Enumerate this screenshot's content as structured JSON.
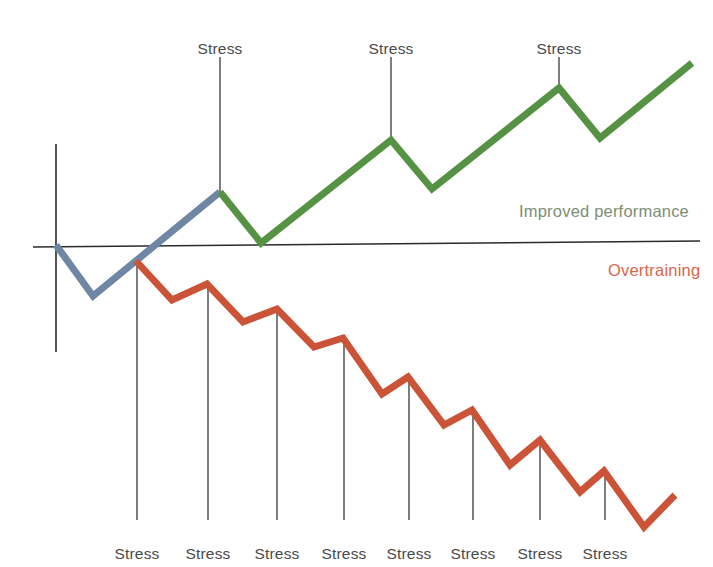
{
  "chart_data": {
    "type": "line",
    "title": "",
    "subtitle": "",
    "xlabel": "",
    "ylabel": "",
    "grid": false,
    "legend_position": "right-inline",
    "xlim": [
      0,
      713
    ],
    "ylim": [
      567,
      0
    ],
    "axes": {
      "x_axis": {
        "x1": 33,
        "y1": 247,
        "x2": 700,
        "y2": 241
      },
      "y_axis": {
        "x1": 56,
        "y1": 144,
        "x2": 56,
        "y2": 352
      },
      "origin": {
        "x": 56,
        "y": 245
      }
    },
    "annotations": [
      {
        "text": "Stress",
        "x": 220,
        "y": 40,
        "position": "top"
      },
      {
        "text": "Stress",
        "x": 391,
        "y": 40,
        "position": "top"
      },
      {
        "text": "Stress",
        "x": 559,
        "y": 40,
        "position": "top"
      },
      {
        "text": "Stress",
        "x": 137,
        "y": 545,
        "position": "bottom"
      },
      {
        "text": "Stress",
        "x": 208,
        "y": 545,
        "position": "bottom"
      },
      {
        "text": "Stress",
        "x": 277,
        "y": 545,
        "position": "bottom"
      },
      {
        "text": "Stress",
        "x": 344,
        "y": 545,
        "position": "bottom"
      },
      {
        "text": "Stress",
        "x": 409,
        "y": 545,
        "position": "bottom"
      },
      {
        "text": "Stress",
        "x": 473,
        "y": 545,
        "position": "bottom"
      },
      {
        "text": "Stress",
        "x": 540,
        "y": 545,
        "position": "bottom"
      },
      {
        "text": "Stress",
        "x": 605,
        "y": 545,
        "position": "bottom"
      }
    ],
    "stress_ticks_top": [
      {
        "x": 220,
        "y1": 57,
        "y2": 192
      },
      {
        "x": 391,
        "y1": 57,
        "y2": 140
      },
      {
        "x": 559,
        "y1": 57,
        "y2": 88
      }
    ],
    "stress_ticks_bottom": [
      {
        "x": 137,
        "y1": 261,
        "y2": 520
      },
      {
        "x": 208,
        "y1": 284,
        "y2": 520
      },
      {
        "x": 277,
        "y1": 309,
        "y2": 520
      },
      {
        "x": 344,
        "y1": 338,
        "y2": 520
      },
      {
        "x": 409,
        "y1": 377,
        "y2": 520
      },
      {
        "x": 473,
        "y1": 410,
        "y2": 520
      },
      {
        "x": 540,
        "y1": 440,
        "y2": 520
      },
      {
        "x": 605,
        "y1": 471,
        "y2": 520
      }
    ],
    "series": [
      {
        "name": "Initial response",
        "color": "#6f87a5",
        "points": [
          [
            56,
            245
          ],
          [
            93,
            296
          ],
          [
            220,
            192
          ]
        ]
      },
      {
        "name": "Improved performance",
        "color": "#569244",
        "points": [
          [
            220,
            192
          ],
          [
            261,
            243
          ],
          [
            391,
            140
          ],
          [
            432,
            189
          ],
          [
            559,
            88
          ],
          [
            600,
            138
          ],
          [
            692,
            63
          ]
        ]
      },
      {
        "name": "Overtraining",
        "color": "#cb5337",
        "points": [
          [
            136,
            261
          ],
          [
            172,
            300
          ],
          [
            207,
            284
          ],
          [
            243,
            322
          ],
          [
            277,
            309
          ],
          [
            314,
            347
          ],
          [
            343,
            338
          ],
          [
            382,
            394
          ],
          [
            408,
            377
          ],
          [
            444,
            425
          ],
          [
            472,
            410
          ],
          [
            510,
            465
          ],
          [
            540,
            440
          ],
          [
            580,
            492
          ],
          [
            604,
            471
          ],
          [
            644,
            527
          ],
          [
            675,
            495
          ]
        ]
      }
    ],
    "legend": [
      {
        "label": "Improved performance",
        "color": "#7d8f72",
        "x": 519,
        "y": 202
      },
      {
        "label": "Overtraining",
        "color": "#d9654a",
        "x": 608,
        "y": 261
      }
    ]
  }
}
